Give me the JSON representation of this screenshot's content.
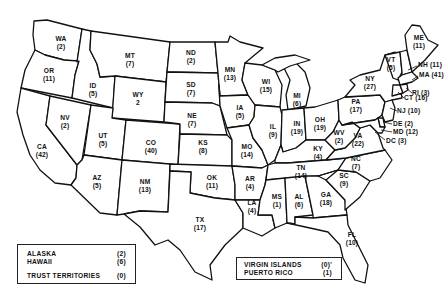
{
  "map": {
    "title": "",
    "states": [
      {
        "abbr": "WA",
        "value": "(2)"
      },
      {
        "abbr": "OR",
        "value": "(11)"
      },
      {
        "abbr": "CA",
        "value": "(42)"
      },
      {
        "abbr": "NV",
        "value": "(2)"
      },
      {
        "abbr": "ID",
        "value": "(5)"
      },
      {
        "abbr": "MT",
        "value": "(7)"
      },
      {
        "abbr": "WY",
        "value": "2"
      },
      {
        "abbr": "UT",
        "value": "(5)"
      },
      {
        "abbr": "AZ",
        "value": "(5)"
      },
      {
        "abbr": "CO",
        "value": "(40)"
      },
      {
        "abbr": "NM",
        "value": "(13)"
      },
      {
        "abbr": "ND",
        "value": "(2)"
      },
      {
        "abbr": "SD",
        "value": "(7)"
      },
      {
        "abbr": "NE",
        "value": "(7)"
      },
      {
        "abbr": "KS",
        "value": "(8)"
      },
      {
        "abbr": "OK",
        "value": "(11)"
      },
      {
        "abbr": "TX",
        "value": "(17)"
      },
      {
        "abbr": "MN",
        "value": "(13)"
      },
      {
        "abbr": "IA",
        "value": "(5)"
      },
      {
        "abbr": "MO",
        "value": "(14)"
      },
      {
        "abbr": "AR",
        "value": "(4)"
      },
      {
        "abbr": "LA",
        "value": "(4)"
      },
      {
        "abbr": "WI",
        "value": "(15)"
      },
      {
        "abbr": "IL",
        "value": "(9)"
      },
      {
        "abbr": "MI",
        "value": "(6)"
      },
      {
        "abbr": "IN",
        "value": "(19)"
      },
      {
        "abbr": "OH",
        "value": "(19)"
      },
      {
        "abbr": "KY",
        "value": "(4)"
      },
      {
        "abbr": "TN",
        "value": "(14)"
      },
      {
        "abbr": "MS",
        "value": "(1)"
      },
      {
        "abbr": "AL",
        "value": "(6)"
      },
      {
        "abbr": "GA",
        "value": "(18)"
      },
      {
        "abbr": "FL",
        "value": "(10)"
      },
      {
        "abbr": "SC",
        "value": "(9)"
      },
      {
        "abbr": "NC",
        "value": "(7)"
      },
      {
        "abbr": "VA",
        "value": "(22)"
      },
      {
        "abbr": "WV",
        "value": "(2)"
      },
      {
        "abbr": "PA",
        "value": "(17)"
      },
      {
        "abbr": "NY",
        "value": "(27)"
      },
      {
        "abbr": "VT",
        "value": "(5)"
      },
      {
        "abbr": "ME",
        "value": "(11)"
      },
      {
        "abbr": "NH",
        "value": "(11)"
      },
      {
        "abbr": "MA",
        "value": "(41)"
      },
      {
        "abbr": "RI",
        "value": "(3)"
      },
      {
        "abbr": "CT",
        "value": "(16)"
      },
      {
        "abbr": "NJ",
        "value": "(10)"
      },
      {
        "abbr": "DE",
        "value": "(2)"
      },
      {
        "abbr": "MD",
        "value": "(12)"
      },
      {
        "abbr": "DC",
        "value": "(3)"
      }
    ]
  },
  "legend_left": {
    "rows": [
      {
        "name": "ALASKA",
        "value": "(2)"
      },
      {
        "name": "HAWAII",
        "value": "(6)"
      },
      {
        "name": "TRUST TERRITORIES",
        "value": "(0)"
      }
    ]
  },
  "legend_right": {
    "rows": [
      {
        "name": "VIRGIN ISLANDS",
        "value": "(0)'"
      },
      {
        "name": "PUERTO RICO",
        "value": "(1)"
      }
    ]
  }
}
